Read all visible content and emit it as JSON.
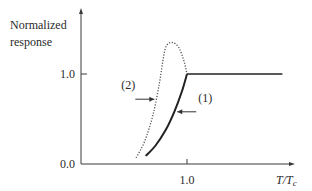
{
  "chart_data": {
    "type": "line",
    "title": "",
    "ylabel_lines": [
      "Normalized",
      "response"
    ],
    "xlabel": "T/Tc",
    "xlabel_parts": {
      "main": "T/T",
      "sub": "c"
    },
    "xlim": [
      0,
      2.0
    ],
    "ylim": [
      0,
      1.5
    ],
    "x_ticks": [
      {
        "value": 1.0,
        "label": "1.0"
      }
    ],
    "y_ticks": [
      {
        "value": 0.0,
        "label": "0.0"
      },
      {
        "value": 1.0,
        "label": "1.0"
      }
    ],
    "grid": false,
    "series": [
      {
        "name": "(1)",
        "style": "solid",
        "points": [
          [
            0.61,
            0.09
          ],
          [
            0.7,
            0.2
          ],
          [
            0.8,
            0.38
          ],
          [
            0.88,
            0.58
          ],
          [
            0.95,
            0.8
          ],
          [
            1.0,
            1.0
          ],
          [
            1.9,
            1.0
          ]
        ]
      },
      {
        "name": "(2)",
        "style": "dotted",
        "points": [
          [
            0.52,
            0.07
          ],
          [
            0.6,
            0.25
          ],
          [
            0.68,
            0.55
          ],
          [
            0.74,
            0.9
          ],
          [
            0.78,
            1.2
          ],
          [
            0.81,
            1.32
          ],
          [
            0.86,
            1.35
          ],
          [
            0.92,
            1.3
          ],
          [
            0.97,
            1.15
          ],
          [
            1.0,
            1.0
          ]
        ]
      }
    ],
    "annotations": [
      {
        "label": "(1)",
        "series": "(1)",
        "at": [
          0.88,
          0.58
        ]
      },
      {
        "label": "(2)",
        "series": "(2)",
        "at": [
          0.72,
          0.72
        ]
      }
    ]
  }
}
